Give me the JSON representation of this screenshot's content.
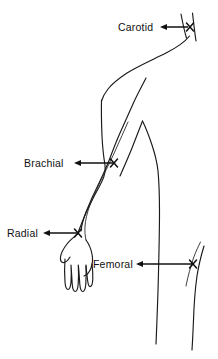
{
  "figure": {
    "background_color": "#ffffff",
    "ink_color": "#111111",
    "width": 218,
    "height": 359
  },
  "labels": {
    "carotid": "Carotid",
    "brachial": "Brachial",
    "radial": "Radial",
    "femoral": "Femoral"
  },
  "pulse_points": [
    {
      "name": "carotid",
      "label": "Carotid",
      "marker": "x-marker",
      "marker_x": 190,
      "marker_y": 27,
      "label_x": 118,
      "label_y": 28,
      "arrow_direction": "left",
      "leader_from_x": 188,
      "leader_to_x": 160
    },
    {
      "name": "brachial",
      "label": "Brachial",
      "marker": "x-marker",
      "marker_x": 114,
      "marker_y": 163,
      "label_x": 24,
      "label_y": 166,
      "arrow_direction": "left",
      "leader_from_x": 112,
      "leader_to_x": 75
    },
    {
      "name": "radial",
      "label": "Radial",
      "marker": "x-marker",
      "marker_x": 78,
      "marker_y": 233,
      "label_x": 7,
      "label_y": 236,
      "arrow_direction": "left",
      "leader_from_x": 76,
      "leader_to_x": 44
    },
    {
      "name": "femoral",
      "label": "Femoral",
      "marker": "x-marker",
      "marker_x": 194,
      "marker_y": 264,
      "label_x": 93,
      "label_y": 267,
      "arrow_direction": "left",
      "leader_from_x": 192,
      "leader_to_x": 137
    }
  ]
}
